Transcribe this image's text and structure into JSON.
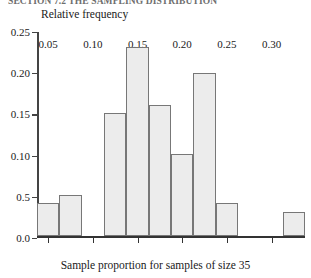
{
  "header": {
    "cropped_text": "SECTION 7.2  THE SAMPLING DISTRIBUTION"
  },
  "chart_data": {
    "type": "bar",
    "title": "",
    "ylabel": "Relative frequency",
    "xlabel": "Sample proportion for samples of size 35",
    "ylim": [
      0.0,
      0.25
    ],
    "xlim": [
      0.0375,
      0.3375
    ],
    "grid": false,
    "legend": null,
    "bin_width": 0.025,
    "ytick_labels": [
      "0.25",
      "0.20",
      "0.15",
      "0.10",
      "0.5",
      "0.0"
    ],
    "ytick_values": [
      0.25,
      0.2,
      0.15,
      0.1,
      0.05,
      0.0
    ],
    "xtick_labels": [
      "0.05",
      "0.10",
      "0.15",
      "0.20",
      "0.25",
      "0.30"
    ],
    "xtick_values": [
      0.05,
      0.1,
      0.15,
      0.2,
      0.25,
      0.3
    ],
    "bars": [
      {
        "x0": 0.0375,
        "x1": 0.0625,
        "value": 0.04
      },
      {
        "x0": 0.0625,
        "x1": 0.0875,
        "value": 0.05
      },
      {
        "x0": 0.0875,
        "x1": 0.1125,
        "value": 0.0
      },
      {
        "x0": 0.1125,
        "x1": 0.1375,
        "value": 0.15
      },
      {
        "x0": 0.1375,
        "x1": 0.1625,
        "value": 0.23
      },
      {
        "x0": 0.1625,
        "x1": 0.1875,
        "value": 0.16
      },
      {
        "x0": 0.1875,
        "x1": 0.2125,
        "value": 0.1
      },
      {
        "x0": 0.2125,
        "x1": 0.2375,
        "value": 0.198
      },
      {
        "x0": 0.2375,
        "x1": 0.2625,
        "value": 0.04
      },
      {
        "x0": 0.2625,
        "x1": 0.2875,
        "value": 0.0
      },
      {
        "x0": 0.2875,
        "x1": 0.3125,
        "value": 0.0
      },
      {
        "x0": 0.3125,
        "x1": 0.3375,
        "value": 0.03
      }
    ],
    "categories": [
      "0.0375-0.0625",
      "0.0625-0.0875",
      "0.0875-0.1125",
      "0.1125-0.1375",
      "0.1375-0.1625",
      "0.1625-0.1875",
      "0.1875-0.2125",
      "0.2125-0.2375",
      "0.2375-0.2625",
      "0.2625-0.2875",
      "0.2875-0.3125",
      "0.3125-0.3375"
    ],
    "values": [
      0.04,
      0.05,
      0.0,
      0.15,
      0.23,
      0.16,
      0.1,
      0.198,
      0.04,
      0.0,
      0.0,
      0.03
    ],
    "colors": {
      "bar_fill": "#ececec",
      "bar_stroke": "#777777",
      "axis": "#333333",
      "text": "#1a1a1a"
    }
  }
}
